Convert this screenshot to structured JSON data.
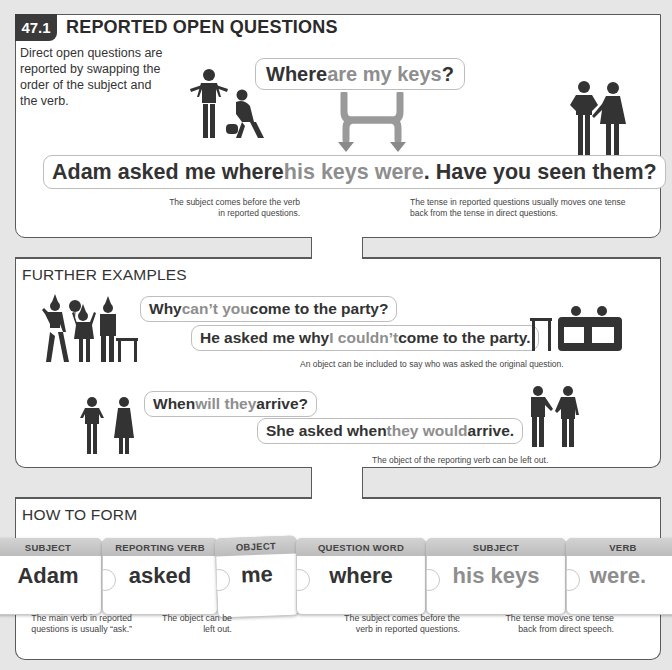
{
  "section_number": "47.1",
  "section_title": "REPORTED OPEN QUESTIONS",
  "intro_text": "Direct open questions are reported by swapping the order of the subject and the verb.",
  "main_example": {
    "direct_question": {
      "w1": "Where",
      "w2": " are my keys",
      "w3": "?"
    },
    "reported_sentence": {
      "w1": "Adam asked me where ",
      "w2": "his keys were",
      "w3": ". Have you seen them?"
    },
    "note_left": "The subject comes before the verb in reported questions.",
    "note_right": "The tense in reported questions usually moves one tense back from the tense in direct questions."
  },
  "further_examples": {
    "title": "FURTHER EXAMPLES",
    "example1": {
      "direct": {
        "w1": "Why ",
        "w2": "can’t you",
        "w3": " come to the party?"
      },
      "reported": {
        "w1": "He asked me why ",
        "w2": "I couldn’t",
        "w3": " come to the party."
      },
      "note": "An object can be included to say who was asked the original question."
    },
    "example2": {
      "direct": {
        "w1": "When ",
        "w2": "will they",
        "w3": " arrive?"
      },
      "reported": {
        "w1": "She asked when ",
        "w2": "they would",
        "w3": " arrive."
      },
      "note": "The object of the reporting verb can be left out."
    }
  },
  "how_to_form": {
    "title": "HOW TO FORM",
    "pieces": [
      {
        "label": "SUBJECT",
        "word": "Adam"
      },
      {
        "label": "REPORTING VERB",
        "word": "asked"
      },
      {
        "label": "OBJECT",
        "word": "me"
      },
      {
        "label": "QUESTION WORD",
        "word": "where"
      },
      {
        "label": "SUBJECT",
        "word": "his keys"
      },
      {
        "label": "VERB",
        "word": "were."
      }
    ],
    "notes": [
      "The main verb in reported questions is usually “ask.”",
      "The object can be left out.",
      "The subject comes before the verb in reported questions.",
      "The tense moves one tense back from direct speech."
    ]
  },
  "colors": {
    "text_dark": "#333333",
    "text_highlight_gray": "#8e8e8e",
    "badge_bg": "#3a3a3a",
    "tab_gray": "#c4c4c4",
    "panel_border": "#5a5a5a",
    "page_bg": "#e6e6e6"
  }
}
